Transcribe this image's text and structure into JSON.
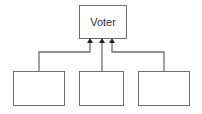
{
  "diagram": {
    "type": "hierarchy",
    "nodes": [
      {
        "id": "voter",
        "label": "Voter",
        "x": 79,
        "y": 5,
        "w": 48,
        "h": 33
      },
      {
        "id": "child-1",
        "label": "",
        "x": 13,
        "y": 71,
        "w": 52,
        "h": 34
      },
      {
        "id": "child-2",
        "label": "",
        "x": 79,
        "y": 71,
        "w": 45,
        "h": 34
      },
      {
        "id": "child-3",
        "label": "",
        "x": 138,
        "y": 71,
        "w": 52,
        "h": 34
      }
    ],
    "edges": [
      {
        "from": "child-1",
        "to": "voter",
        "arrow": "filled"
      },
      {
        "from": "child-2",
        "to": "voter",
        "arrow": "filled"
      },
      {
        "from": "child-3",
        "to": "voter",
        "arrow": "filled"
      }
    ],
    "colors": {
      "stroke": "#6e6e6e",
      "arrow": "#222222",
      "text": "#333333"
    }
  }
}
